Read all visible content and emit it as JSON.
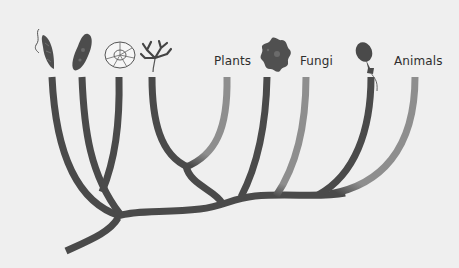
{
  "diagram": {
    "type": "phylogenetic-tree",
    "colors": {
      "background": "#efefef",
      "branch_dark": "#4a4a4a",
      "branch_light": "#8e8e8e",
      "label_text": "#2e2e2e"
    },
    "labels": {
      "plants": "Plants",
      "fungi": "Fungi",
      "animals": "Animals"
    },
    "organism_icons": [
      {
        "name": "euglena-icon"
      },
      {
        "name": "paramecium-icon"
      },
      {
        "name": "foraminifera-icon"
      },
      {
        "name": "red-algae-icon"
      },
      {
        "name": "amoeba-icon"
      },
      {
        "name": "choanoflagellate-icon"
      }
    ],
    "branches": [
      {
        "name": "branch-euglena",
        "shade": "dark"
      },
      {
        "name": "branch-paramecium",
        "shade": "dark"
      },
      {
        "name": "branch-foraminifera",
        "shade": "dark"
      },
      {
        "name": "branch-red-algae",
        "shade": "dark"
      },
      {
        "name": "branch-plants",
        "shade": "light"
      },
      {
        "name": "branch-amoeba",
        "shade": "dark"
      },
      {
        "name": "branch-fungi",
        "shade": "light"
      },
      {
        "name": "branch-choanoflagellate",
        "shade": "dark"
      },
      {
        "name": "branch-animals",
        "shade": "light"
      }
    ]
  }
}
